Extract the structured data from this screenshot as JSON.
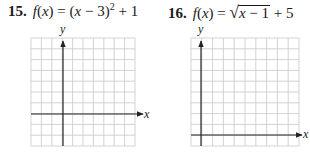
{
  "problems": [
    {
      "number": "15.",
      "function_name": "f",
      "variable": "x",
      "equals": "=",
      "expression_parts": {
        "open": "(",
        "var": "x",
        "minus": " − 3)",
        "exponent": "2",
        "tail": " + 1"
      },
      "full_expression": "f(x) = (x − 3)^2 + 1",
      "graph": {
        "x_axis_label": "x",
        "y_axis_label": "y",
        "columns": 10,
        "rows": 10,
        "y_axis_column": 3,
        "x_axis_row": 7.5
      }
    },
    {
      "number": "16.",
      "function_name": "f",
      "variable": "x",
      "equals": "=",
      "expression_parts": {
        "radicand_var": "x",
        "radicand_rest": " − 1",
        "tail": " + 5"
      },
      "full_expression": "f(x) = √(x − 1) + 5",
      "graph": {
        "x_axis_label": "x",
        "y_axis_label": "y",
        "columns": 10,
        "rows": 10,
        "y_axis_column": 1,
        "x_axis_row": 9.3
      }
    }
  ],
  "colors": {
    "grid": "#c8c8c8",
    "axis": "#222222",
    "text": "#1a1a1a"
  }
}
